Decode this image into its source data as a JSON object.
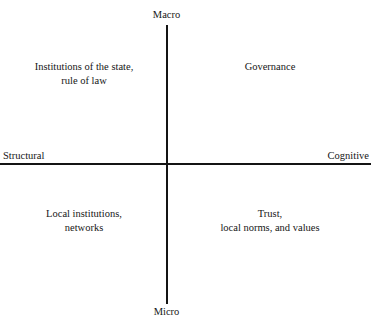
{
  "diagram": {
    "type": "two-by-two-matrix",
    "axes": {
      "vertical": {
        "top_label": "Macro",
        "bottom_label": "Micro"
      },
      "horizontal": {
        "left_label": "Structural",
        "right_label": "Cognitive"
      }
    },
    "quadrants": {
      "top_left": "Institutions of the state,\nrule of law",
      "top_right": "Governance",
      "bottom_left": "Local institutions,\nnetworks",
      "bottom_right": "Trust,\nlocal norms, and values"
    },
    "colors": {
      "background": "#ffffff",
      "axis": "#141414",
      "text": "#161616"
    }
  }
}
